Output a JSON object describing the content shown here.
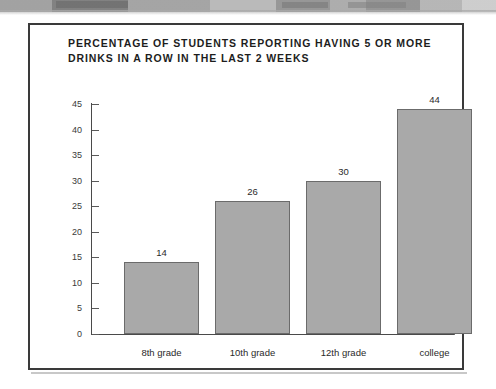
{
  "figure": {
    "title": "PERCENTAGE OF STUDENTS REPORTING HAVING 5 OR MORE DRINKS IN A ROW IN THE LAST 2 WEEKS",
    "frame_color": "#3a3a3a",
    "background": "#ffffff"
  },
  "chart_data": {
    "type": "bar",
    "title": "PERCENTAGE OF STUDENTS REPORTING HAVING 5 OR MORE DRINKS IN A ROW IN THE LAST 2 WEEKS",
    "xlabel": "",
    "ylabel": "",
    "categories": [
      "8th grade",
      "10th grade",
      "12th grade",
      "college"
    ],
    "values": [
      14,
      26,
      30,
      44
    ],
    "data_labels": [
      "14",
      "26",
      "30",
      "44"
    ],
    "ylim": [
      0,
      45
    ],
    "ytick_labels": [
      "45",
      "40",
      "35",
      "30",
      "25",
      "20",
      "15",
      "10",
      "5",
      "0"
    ],
    "ytick_values": [
      45,
      40,
      35,
      30,
      25,
      20,
      15,
      10,
      5,
      0
    ],
    "grid": false,
    "legend": null,
    "bar_fill_color": "#a9a9a9",
    "bar_edge_color": "#6b6b6b",
    "axis_color": "#4a4a4a"
  }
}
